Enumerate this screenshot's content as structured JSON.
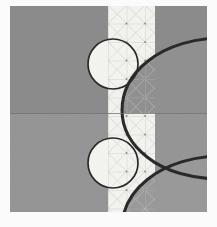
{
  "figure": {
    "title": "Periodic bulb-shaped inclusion array with triangular finite-element mesh",
    "width": 217,
    "height": 227,
    "background_color": "#fbfbfb"
  },
  "canvas": {
    "plate": {
      "x": 10,
      "y": 6,
      "width": 197,
      "height": 206
    },
    "seam": {
      "orientation": "horizontal",
      "y": 113,
      "color": "#6f6f6f",
      "label": "mid-plane seam line"
    }
  },
  "regions": [
    {
      "name": "matrix-left",
      "type": "solid-fill",
      "fill": "#8a8a8a",
      "x": 10,
      "y": 6,
      "width": 145,
      "height": 107
    },
    {
      "name": "matrix-left-lower",
      "type": "solid-fill",
      "fill": "#949494",
      "x": 10,
      "y": 113,
      "width": 145,
      "height": 99
    },
    {
      "name": "mesh-band",
      "type": "meshed-strip",
      "fill": "#f3f3f0",
      "x": 108,
      "y": 6,
      "width": 47,
      "height": 206
    },
    {
      "name": "matrix-right",
      "type": "solid-fill",
      "fill": "#8a8a8a",
      "x": 155,
      "y": 6,
      "width": 52,
      "height": 107
    },
    {
      "name": "matrix-right-lower",
      "type": "solid-fill",
      "fill": "#949494",
      "x": 155,
      "y": 113,
      "width": 52,
      "height": 99
    }
  ],
  "mesh": {
    "cell_size": 18.5,
    "origin_x": 108,
    "origin_y": 5,
    "columns": 3,
    "rows": 12,
    "line_color": "#b9b9b4",
    "diagonal_color": "#c4c4bf",
    "line_width": 0.6,
    "pattern": "quadrilateral cells subdivided by both diagonals (4-triangle cross)",
    "node_color": "#8d8d88"
  },
  "inclusions": {
    "outline_color": "#262626",
    "outline_width": 1.7,
    "bulb_fill": "#8f8f8f",
    "bulb_fill_lower": "#979797",
    "circle_fill": "#f4f4f1",
    "center_x": 113,
    "period": 70,
    "shapes": [
      {
        "name": "bulb-top-partial",
        "type": "bulb",
        "cy": -5,
        "rx": 53,
        "ry": 34
      },
      {
        "name": "circle-upper",
        "type": "circle",
        "cy": 64,
        "r": 25
      },
      {
        "name": "bulb-middle",
        "type": "bulb",
        "cy": 113,
        "rx": 53,
        "ry": 34
      },
      {
        "name": "circle-lower",
        "type": "circle",
        "cy": 163,
        "r": 25
      },
      {
        "name": "bulb-bottom",
        "type": "bulb",
        "cy": 212,
        "rx": 53,
        "ry": 34
      }
    ]
  },
  "colors": {
    "matrix_gray": "#8a8a8a",
    "matrix_gray_lower": "#949494",
    "mesh_light": "#f3f3f0",
    "outline_dark": "#262626",
    "page_white": "#fbfbfb"
  }
}
